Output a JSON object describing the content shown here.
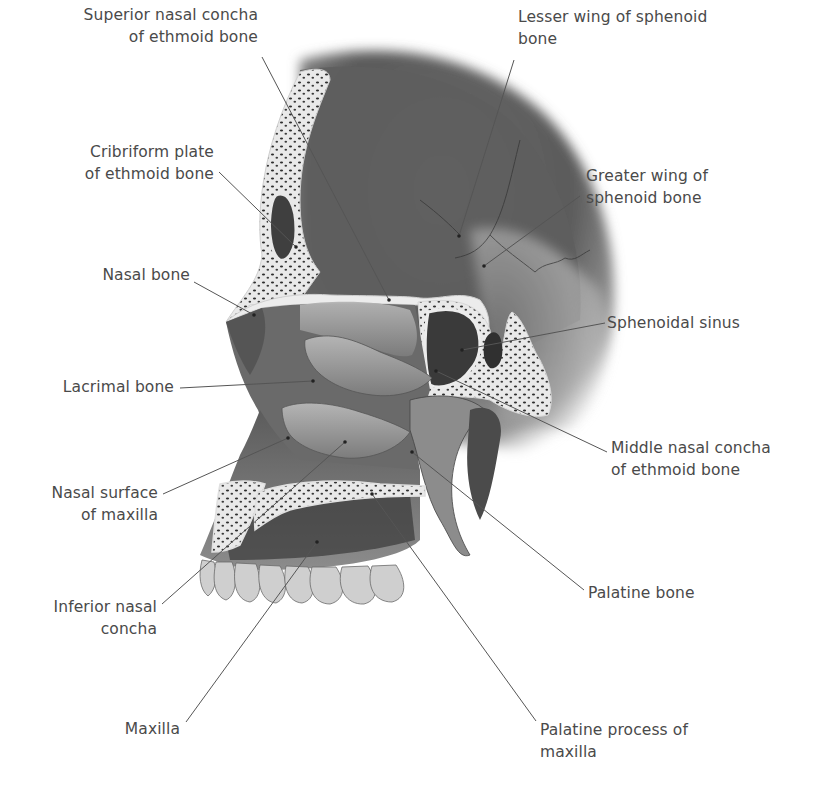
{
  "diagram": {
    "colors": {
      "background": "#ffffff",
      "label_text": "#4a4a4a",
      "leader_line": "#555555",
      "bone_dark": "#4f4f4f",
      "bone_mid": "#7d7d7d",
      "bone_light": "#b9b9b9",
      "cut_surface": "#ececec",
      "trabecular_dots": "#2e2e2e"
    },
    "labels": [
      {
        "id": "superior-nasal-concha",
        "lines": [
          "Superior nasal concha",
          "of ethmoid bone"
        ],
        "align": "right",
        "x": 48,
        "y": 36,
        "w": 210,
        "pointer": {
          "from": [
            262,
            57
          ],
          "to": [
            389,
            300
          ]
        }
      },
      {
        "id": "lesser-wing-sphenoid",
        "lines": [
          "Lesser wing of sphenoid",
          "bone"
        ],
        "align": "left",
        "x": 518,
        "y": 38,
        "w": 240,
        "pointer": {
          "from": [
            514,
            60
          ],
          "to": [
            459,
            236
          ]
        }
      },
      {
        "id": "cribriform-plate",
        "lines": [
          "Cribriform plate",
          "of ethmoid bone"
        ],
        "align": "right",
        "x": 40,
        "y": 140,
        "w": 174,
        "pointer": {
          "from": [
            219,
            172
          ],
          "to": [
            296,
            247
          ]
        }
      },
      {
        "id": "greater-wing-sphenoid",
        "lines": [
          "Greater wing of",
          "sphenoid bone"
        ],
        "align": "left",
        "x": 586,
        "y": 165,
        "w": 160,
        "pointer": {
          "from": [
            580,
            196
          ],
          "to": [
            484,
            266
          ]
        }
      },
      {
        "id": "nasal-bone",
        "lines": [
          "Nasal bone"
        ],
        "align": "right",
        "x": 60,
        "y": 265,
        "w": 130,
        "pointer": {
          "from": [
            194,
            282
          ],
          "to": [
            254,
            315
          ]
        }
      },
      {
        "id": "sphenoidal-sinus",
        "lines": [
          "Sphenoidal sinus"
        ],
        "align": "left",
        "x": 607,
        "y": 312,
        "w": 170,
        "pointer": {
          "from": [
            605,
            323
          ],
          "to": [
            462,
            350
          ]
        }
      },
      {
        "id": "lacrimal-bone",
        "lines": [
          "Lacrimal bone"
        ],
        "align": "right",
        "x": 28,
        "y": 376,
        "w": 146,
        "pointer": {
          "from": [
            180,
            388
          ],
          "to": [
            313,
            381
          ]
        }
      },
      {
        "id": "middle-nasal-concha",
        "lines": [
          "Middle nasal concha",
          "of ethmoid bone"
        ],
        "align": "left",
        "x": 611,
        "y": 437,
        "w": 200,
        "pointer": {
          "from": [
            607,
            452
          ],
          "to": [
            436,
            371
          ]
        }
      },
      {
        "id": "nasal-surface-maxilla",
        "lines": [
          "Nasal surface",
          "of maxilla"
        ],
        "align": "right",
        "x": 30,
        "y": 481,
        "w": 128,
        "pointer": {
          "from": [
            163,
            494
          ],
          "to": [
            288,
            438
          ]
        }
      },
      {
        "id": "inferior-nasal-concha",
        "lines": [
          "Inferior nasal",
          "concha"
        ],
        "align": "right",
        "x": 30,
        "y": 596,
        "w": 127,
        "pointer": {
          "from": [
            162,
            604
          ],
          "to": [
            345,
            442
          ]
        }
      },
      {
        "id": "palatine-bone",
        "lines": [
          "Palatine bone"
        ],
        "align": "left",
        "x": 588,
        "y": 583,
        "w": 140,
        "pointer": {
          "from": [
            584,
            590
          ],
          "to": [
            412,
            452
          ]
        }
      },
      {
        "id": "maxilla",
        "lines": [
          "Maxilla"
        ],
        "align": "right",
        "x": 60,
        "y": 717,
        "w": 120,
        "pointer": {
          "from": [
            186,
            722
          ],
          "to": [
            317,
            542
          ]
        }
      },
      {
        "id": "palatine-process-maxilla",
        "lines": [
          "Palatine process of",
          "maxilla"
        ],
        "align": "left",
        "x": 540,
        "y": 714,
        "w": 200,
        "pointer": {
          "from": [
            536,
            721
          ],
          "to": [
            372,
            494
          ]
        }
      }
    ]
  }
}
